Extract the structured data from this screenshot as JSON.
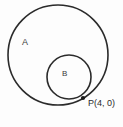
{
  "figure": {
    "background_color": "#fdfdfd",
    "stroke_color": "#2b2b2b",
    "label_color": "#3a3a3a",
    "width": 123,
    "height": 127
  },
  "labels": {
    "circle_a": "A",
    "circle_b": "B",
    "tangent_point": "P(4, 0)"
  },
  "chart_data": {
    "type": "diagram",
    "subtype": "geometry-circles",
    "shapes": [
      {
        "name": "circle-a",
        "label": "A",
        "kind": "circle",
        "cx": 58,
        "cy": 55,
        "r": 50
      },
      {
        "name": "circle-b",
        "label": "B",
        "kind": "circle",
        "cx": 69,
        "cy": 77,
        "r": 22
      },
      {
        "name": "tangent-point",
        "label": "P(4, 0)",
        "kind": "point",
        "cx": 83,
        "cy": 98,
        "r": 2.1
      }
    ],
    "annotations": [
      {
        "text": "A",
        "x": 22,
        "y": 38
      },
      {
        "text": "B",
        "x": 62,
        "y": 70
      },
      {
        "text": "P(4, 0)",
        "x": 88,
        "y": 99
      }
    ],
    "relations": [
      {
        "type": "internally-tangent",
        "between": [
          "circle-a",
          "circle-b"
        ],
        "at": "P(4, 0)"
      }
    ],
    "grid": false,
    "legend": false
  }
}
